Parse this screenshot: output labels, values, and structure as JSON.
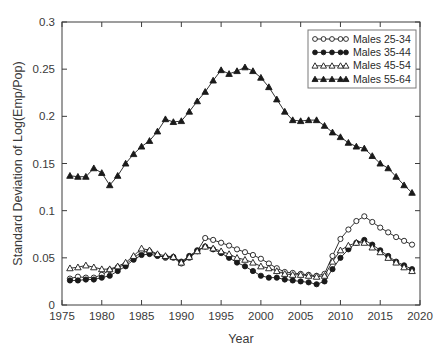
{
  "chart_data": {
    "type": "line",
    "title": "",
    "xlabel": "Year",
    "ylabel": "Standard Deviation of Log(Emp/Pop)",
    "xlim": [
      1975,
      2020
    ],
    "ylim": [
      0,
      0.3
    ],
    "grid": false,
    "legend_position": "top-right",
    "xticks": [
      "1975",
      "1980",
      "1985",
      "1990",
      "1995",
      "2000",
      "2005",
      "2010",
      "2015",
      "2020"
    ],
    "xtick_values": [
      1975,
      1980,
      1985,
      1990,
      1995,
      2000,
      2005,
      2010,
      2015,
      2020
    ],
    "yticks": [
      "0",
      "0.05",
      "0.1",
      "0.15",
      "0.2",
      "0.25",
      "0.3"
    ],
    "ytick_values": [
      0,
      0.05,
      0.1,
      0.15,
      0.2,
      0.25,
      0.3
    ],
    "x": [
      1976,
      1977,
      1978,
      1979,
      1980,
      1981,
      1982,
      1983,
      1984,
      1985,
      1986,
      1987,
      1988,
      1989,
      1990,
      1991,
      1992,
      1993,
      1994,
      1995,
      1996,
      1997,
      1998,
      1999,
      2000,
      2001,
      2002,
      2003,
      2004,
      2005,
      2006,
      2007,
      2008,
      2009,
      2010,
      2011,
      2012,
      2013,
      2014,
      2015,
      2016,
      2017,
      2018,
      2019
    ],
    "series": [
      {
        "name": "Males 25-34",
        "marker": "open-circle",
        "values": [
          0.028,
          0.03,
          0.029,
          0.029,
          0.032,
          0.037,
          0.04,
          0.043,
          0.05,
          0.056,
          0.057,
          0.053,
          0.05,
          0.05,
          0.044,
          0.05,
          0.057,
          0.071,
          0.069,
          0.066,
          0.063,
          0.059,
          0.056,
          0.053,
          0.049,
          0.044,
          0.039,
          0.035,
          0.034,
          0.033,
          0.032,
          0.031,
          0.033,
          0.052,
          0.07,
          0.08,
          0.089,
          0.094,
          0.088,
          0.082,
          0.077,
          0.072,
          0.068,
          0.064
        ]
      },
      {
        "name": "Males 35-44",
        "marker": "filled-circle",
        "values": [
          0.026,
          0.026,
          0.027,
          0.027,
          0.029,
          0.031,
          0.036,
          0.041,
          0.048,
          0.053,
          0.054,
          0.052,
          0.051,
          0.051,
          0.046,
          0.052,
          0.058,
          0.062,
          0.059,
          0.055,
          0.05,
          0.045,
          0.041,
          0.036,
          0.031,
          0.029,
          0.029,
          0.027,
          0.026,
          0.025,
          0.024,
          0.022,
          0.025,
          0.038,
          0.05,
          0.059,
          0.066,
          0.069,
          0.064,
          0.058,
          0.052,
          0.046,
          0.042,
          0.038
        ]
      },
      {
        "name": "Males 45-54",
        "marker": "open-triangle",
        "values": [
          0.039,
          0.04,
          0.042,
          0.04,
          0.038,
          0.038,
          0.041,
          0.045,
          0.052,
          0.06,
          0.058,
          0.054,
          0.052,
          0.051,
          0.045,
          0.051,
          0.057,
          0.062,
          0.06,
          0.057,
          0.054,
          0.05,
          0.048,
          0.045,
          0.041,
          0.039,
          0.036,
          0.033,
          0.032,
          0.032,
          0.031,
          0.03,
          0.031,
          0.046,
          0.058,
          0.063,
          0.066,
          0.066,
          0.061,
          0.056,
          0.05,
          0.045,
          0.04,
          0.036
        ]
      },
      {
        "name": "Males 55-64",
        "marker": "filled-triangle",
        "values": [
          0.137,
          0.136,
          0.136,
          0.145,
          0.14,
          0.127,
          0.137,
          0.15,
          0.16,
          0.168,
          0.174,
          0.184,
          0.197,
          0.194,
          0.195,
          0.205,
          0.216,
          0.226,
          0.238,
          0.249,
          0.245,
          0.248,
          0.252,
          0.248,
          0.241,
          0.231,
          0.218,
          0.205,
          0.196,
          0.195,
          0.196,
          0.196,
          0.19,
          0.183,
          0.178,
          0.172,
          0.168,
          0.166,
          0.158,
          0.15,
          0.145,
          0.136,
          0.127,
          0.119
        ]
      }
    ]
  },
  "legend": {
    "entries": [
      {
        "label": "Males 25-34"
      },
      {
        "label": "Males 35-44"
      },
      {
        "label": "Males 45-54"
      },
      {
        "label": "Males 55-64"
      }
    ]
  }
}
